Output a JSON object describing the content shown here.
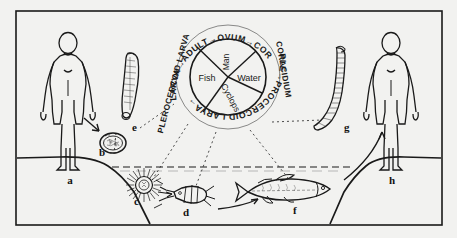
{
  "figure": {
    "border_color": "#1a1a1a",
    "paper_color": "#f2f2f0",
    "ink_color": "#1a1a1a"
  },
  "cycle_diagram": {
    "outer_ring_sequence": [
      "PLEROCERCOID LARVA",
      "ADULT",
      "OVUM",
      "CORACIDIUM",
      "PROCERCOID LARVA"
    ],
    "ring_arrow_glyph": "→",
    "ring_text_upper": "LARVA→ADULT→OVUM→COR",
    "ring_text_left": "PLEROCERCOID LARVA",
    "ring_text_right": "CORACIDIUM",
    "ring_text_lower": "PLE→PROCERCOID LARVA→",
    "segments": [
      {
        "id": "man",
        "label": "Man"
      },
      {
        "id": "water",
        "label": "Water"
      },
      {
        "id": "cyclops",
        "label": "Cyclops"
      },
      {
        "id": "fish",
        "label": "Fish"
      }
    ]
  },
  "stage_labels": [
    {
      "key": "a",
      "text": "a",
      "meaning": "infected-man-left"
    },
    {
      "key": "b",
      "text": "b",
      "meaning": "ovum-egg"
    },
    {
      "key": "c",
      "text": "c",
      "meaning": "coracidium"
    },
    {
      "key": "d",
      "text": "d",
      "meaning": "cyclops-copepod"
    },
    {
      "key": "e",
      "text": "e",
      "meaning": "plerocercoid-larva"
    },
    {
      "key": "f",
      "text": "f",
      "meaning": "fish"
    },
    {
      "key": "g",
      "text": "g",
      "meaning": "adult-tapeworm"
    },
    {
      "key": "h",
      "text": "h",
      "meaning": "man-right"
    }
  ],
  "scene": {
    "left_figure": "human-figure",
    "right_figure": "human-figure",
    "waterline": "dashed",
    "water_label": "pond-water"
  }
}
